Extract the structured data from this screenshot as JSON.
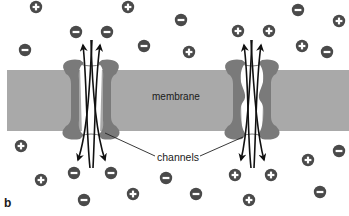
{
  "figure": {
    "panel_label": "b",
    "labels": {
      "membrane": "membrane",
      "channels": "channels"
    }
  },
  "colors": {
    "membrane": "#a9a9a9",
    "channel_protein": "#7a7a7a",
    "ion": "#4a4a4a",
    "arrow": "#111111"
  },
  "membrane": {
    "x": 7,
    "y": 70,
    "width": 342,
    "height": 61
  },
  "channels": [
    {
      "name": "left-channel",
      "center_x": 91,
      "shape": "straight",
      "ion_type": "negative"
    },
    {
      "name": "right-channel",
      "center_x": 252,
      "shape": "constricted",
      "ion_type": "positive"
    }
  ],
  "ions": [
    {
      "charge": "+",
      "x": 36,
      "y": 7
    },
    {
      "charge": "-",
      "x": 76,
      "y": 32
    },
    {
      "charge": "-",
      "x": 107,
      "y": 32
    },
    {
      "charge": "-",
      "x": 25,
      "y": 50
    },
    {
      "charge": "+",
      "x": 128,
      "y": 7
    },
    {
      "charge": "-",
      "x": 181,
      "y": 20
    },
    {
      "charge": "-",
      "x": 144,
      "y": 46
    },
    {
      "charge": "+",
      "x": 189,
      "y": 52
    },
    {
      "charge": "+",
      "x": 238,
      "y": 31
    },
    {
      "charge": "+",
      "x": 269,
      "y": 31
    },
    {
      "charge": "-",
      "x": 298,
      "y": 10
    },
    {
      "charge": "+",
      "x": 339,
      "y": 21
    },
    {
      "charge": "+",
      "x": 302,
      "y": 46
    },
    {
      "charge": "-",
      "x": 327,
      "y": 52
    },
    {
      "charge": "+",
      "x": 21,
      "y": 146
    },
    {
      "charge": "+",
      "x": 41,
      "y": 180
    },
    {
      "charge": "-",
      "x": 74,
      "y": 173
    },
    {
      "charge": "-",
      "x": 111,
      "y": 173
    },
    {
      "charge": "-",
      "x": 84,
      "y": 200
    },
    {
      "charge": "+",
      "x": 133,
      "y": 194
    },
    {
      "charge": "-",
      "x": 166,
      "y": 178
    },
    {
      "charge": "-",
      "x": 196,
      "y": 194
    },
    {
      "charge": "+",
      "x": 235,
      "y": 175
    },
    {
      "charge": "+",
      "x": 271,
      "y": 175
    },
    {
      "charge": "+",
      "x": 249,
      "y": 200
    },
    {
      "charge": "+",
      "x": 308,
      "y": 160
    },
    {
      "charge": "-",
      "x": 339,
      "y": 151
    },
    {
      "charge": "-",
      "x": 320,
      "y": 192
    }
  ]
}
